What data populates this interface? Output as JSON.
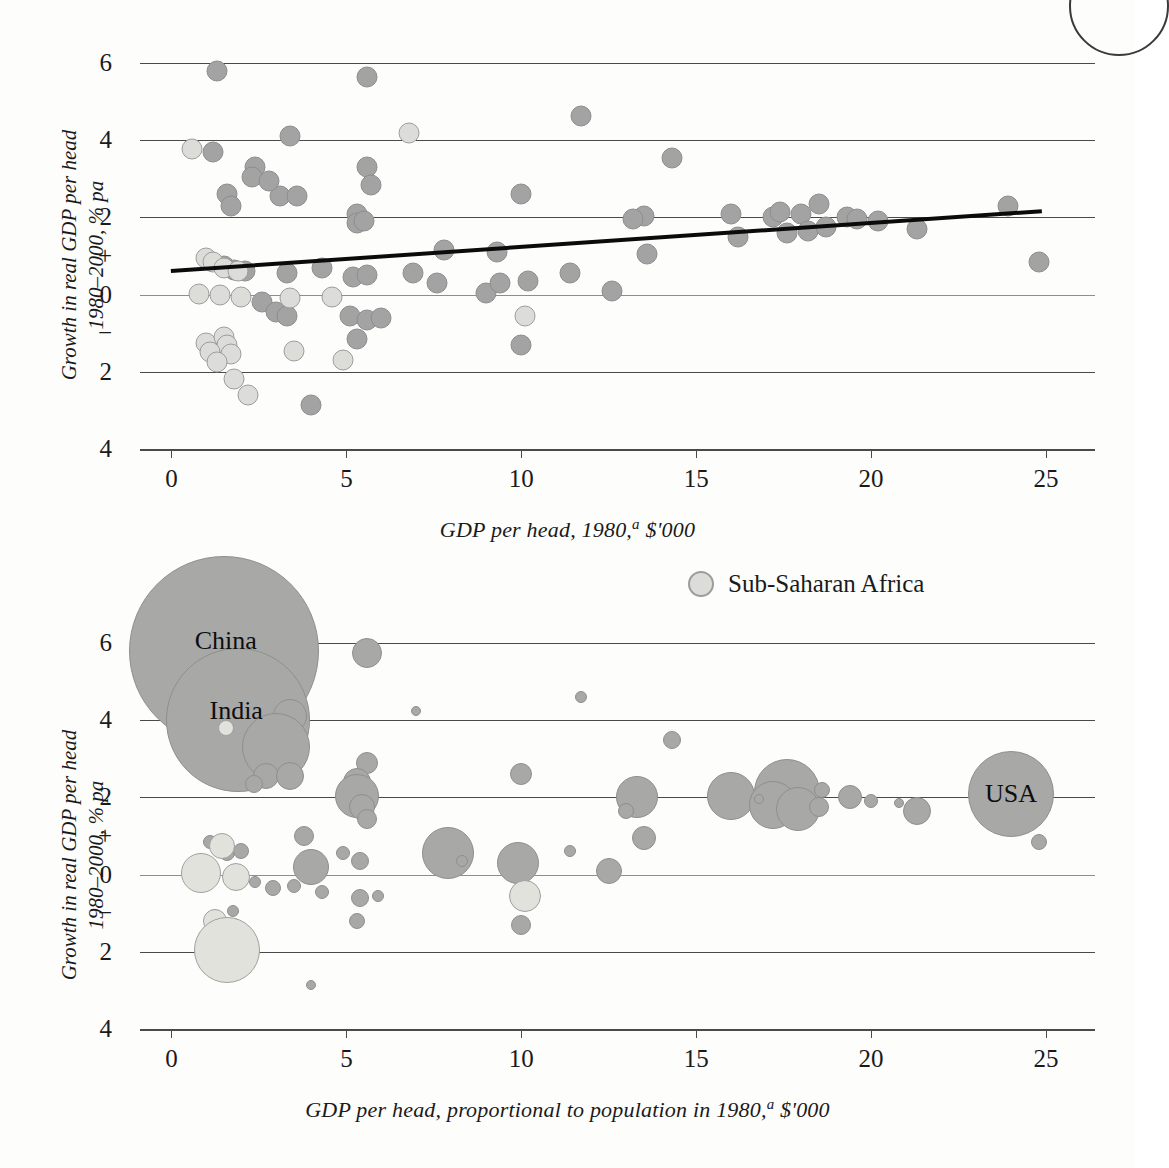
{
  "legend": {
    "label": "Sub-Saharan Africa",
    "swatch_color": "#dcdcd8",
    "position": "above-lower-chart-right"
  },
  "colors": {
    "dot_normal": "#a3a3a3",
    "dot_sub_saharan": "#dcdcd8",
    "gridline": "#4a4a4a",
    "trendline": "#0b0b0b",
    "background": "#fdfdfc"
  },
  "axis": {
    "y_ticks": [
      "6",
      "4",
      "2",
      "0",
      "2",
      "4"
    ],
    "y_tick_values": [
      6,
      4,
      2,
      0,
      -2,
      -4
    ],
    "y_sign_plus": "+",
    "y_sign_minus": "−",
    "x_ticks": [
      "0",
      "5",
      "10",
      "15",
      "20",
      "25"
    ],
    "x_tick_values": [
      0,
      5,
      10,
      15,
      20,
      25
    ],
    "y_title_line1": "Growth in real GDP per head",
    "y_title_line2": "1980–2000, % pa"
  },
  "chart_data": [
    {
      "id": "upper",
      "type": "scatter",
      "title": "",
      "xlabel": "GDP per head, 1980,ᵃ $'000",
      "xlabel_main": "GDP per head, 1980,",
      "xlabel_sup": "a",
      "xlabel_tail": " $'000",
      "ylabel": "Growth in real GDP per head 1980–2000, % pa",
      "xlim": [
        -0.9,
        26.4
      ],
      "ylim": [
        -4.6,
        6.6
      ],
      "grid": true,
      "legend_position": "none",
      "trendline": {
        "x1": 0.0,
        "y1": 0.62,
        "x2": 24.9,
        "y2": 2.17,
        "label": "fitted trend"
      },
      "series": [
        {
          "name": "Countries",
          "marker": "circle",
          "color": "#a3a3a3",
          "points": [
            {
              "x": 1.3,
              "y": 5.8
            },
            {
              "x": 5.6,
              "y": 5.65
            },
            {
              "x": 11.7,
              "y": 4.62
            },
            {
              "x": 3.4,
              "y": 4.1
            },
            {
              "x": 1.2,
              "y": 3.7
            },
            {
              "x": 14.3,
              "y": 3.55
            },
            {
              "x": 2.4,
              "y": 3.3
            },
            {
              "x": 2.3,
              "y": 3.05
            },
            {
              "x": 5.6,
              "y": 3.3
            },
            {
              "x": 5.7,
              "y": 2.85
            },
            {
              "x": 1.6,
              "y": 2.6
            },
            {
              "x": 1.7,
              "y": 2.3
            },
            {
              "x": 3.1,
              "y": 2.55
            },
            {
              "x": 3.6,
              "y": 2.55
            },
            {
              "x": 10.0,
              "y": 2.6
            },
            {
              "x": 2.8,
              "y": 2.95
            },
            {
              "x": 5.3,
              "y": 2.1
            },
            {
              "x": 5.3,
              "y": 1.85
            },
            {
              "x": 5.5,
              "y": 1.9
            },
            {
              "x": 7.8,
              "y": 1.15
            },
            {
              "x": 9.3,
              "y": 1.1
            },
            {
              "x": 13.5,
              "y": 2.05
            },
            {
              "x": 13.2,
              "y": 1.95
            },
            {
              "x": 13.6,
              "y": 1.05
            },
            {
              "x": 16.0,
              "y": 2.1
            },
            {
              "x": 16.2,
              "y": 1.5
            },
            {
              "x": 17.2,
              "y": 2.0
            },
            {
              "x": 17.4,
              "y": 2.15
            },
            {
              "x": 17.6,
              "y": 1.6
            },
            {
              "x": 18.0,
              "y": 2.1
            },
            {
              "x": 18.2,
              "y": 1.65
            },
            {
              "x": 18.5,
              "y": 2.35
            },
            {
              "x": 18.7,
              "y": 1.75
            },
            {
              "x": 19.3,
              "y": 2.0
            },
            {
              "x": 19.6,
              "y": 1.95
            },
            {
              "x": 20.2,
              "y": 1.9
            },
            {
              "x": 21.3,
              "y": 1.7
            },
            {
              "x": 23.9,
              "y": 2.3
            },
            {
              "x": 24.8,
              "y": 0.85
            },
            {
              "x": 4.3,
              "y": 0.7
            },
            {
              "x": 3.3,
              "y": 0.55
            },
            {
              "x": 5.2,
              "y": 0.45
            },
            {
              "x": 5.6,
              "y": 0.5
            },
            {
              "x": 6.9,
              "y": 0.55
            },
            {
              "x": 7.6,
              "y": 0.3
            },
            {
              "x": 9.0,
              "y": 0.05
            },
            {
              "x": 9.4,
              "y": 0.3
            },
            {
              "x": 10.2,
              "y": 0.35
            },
            {
              "x": 11.4,
              "y": 0.55
            },
            {
              "x": 12.6,
              "y": 0.1
            },
            {
              "x": 2.6,
              "y": -0.2
            },
            {
              "x": 3.0,
              "y": -0.45
            },
            {
              "x": 3.3,
              "y": -0.55
            },
            {
              "x": 5.1,
              "y": -0.55
            },
            {
              "x": 5.6,
              "y": -0.65
            },
            {
              "x": 6.0,
              "y": -0.6
            },
            {
              "x": 5.3,
              "y": -1.15
            },
            {
              "x": 10.0,
              "y": -1.3
            },
            {
              "x": 4.0,
              "y": -2.85
            },
            {
              "x": 1.5,
              "y": 0.75
            },
            {
              "x": 1.8,
              "y": 0.65
            },
            {
              "x": 2.1,
              "y": 0.6
            }
          ]
        },
        {
          "name": "Sub-Saharan Africa",
          "marker": "circle",
          "color": "#dcdcd8",
          "points": [
            {
              "x": 0.6,
              "y": 3.78
            },
            {
              "x": 6.8,
              "y": 4.2
            },
            {
              "x": 1.0,
              "y": 0.95
            },
            {
              "x": 1.2,
              "y": 0.85
            },
            {
              "x": 1.5,
              "y": 0.7
            },
            {
              "x": 1.9,
              "y": 0.6
            },
            {
              "x": 0.8,
              "y": 0.02
            },
            {
              "x": 1.4,
              "y": 0.0
            },
            {
              "x": 2.0,
              "y": -0.05
            },
            {
              "x": 3.4,
              "y": -0.1
            },
            {
              "x": 4.6,
              "y": -0.05
            },
            {
              "x": 3.5,
              "y": -1.45
            },
            {
              "x": 1.0,
              "y": -1.25
            },
            {
              "x": 1.5,
              "y": -1.1
            },
            {
              "x": 1.6,
              "y": -1.3
            },
            {
              "x": 1.1,
              "y": -1.5
            },
            {
              "x": 1.7,
              "y": -1.55
            },
            {
              "x": 1.3,
              "y": -1.75
            },
            {
              "x": 4.9,
              "y": -1.7
            },
            {
              "x": 1.8,
              "y": -2.2
            },
            {
              "x": 2.2,
              "y": -2.6
            },
            {
              "x": 10.1,
              "y": -0.55
            }
          ]
        }
      ]
    },
    {
      "id": "lower",
      "type": "scatter",
      "title": "",
      "xlabel": "GDP per head, proportional to population in 1980,ᵃ $'000",
      "xlabel_main": "GDP per head, proportional to population in 1980,",
      "xlabel_sup": "a",
      "xlabel_tail": " $'000",
      "ylabel": "Growth in real GDP per head 1980–2000, % pa",
      "xlim": [
        -0.9,
        26.4
      ],
      "ylim": [
        -4.6,
        6.6
      ],
      "grid": true,
      "bubble_size_encodes": "population in 1980",
      "legend_position": "above-right",
      "annotations": [
        {
          "text": "China",
          "x": 1.55,
          "y": 6.05
        },
        {
          "text": "India",
          "x": 1.85,
          "y": 4.25
        },
        {
          "text": "USA",
          "x": 24.0,
          "y": 2.1
        }
      ],
      "series": [
        {
          "name": "Countries",
          "marker": "bubble",
          "color": "#a8a8a6",
          "points": [
            {
              "x": 1.5,
              "y": 5.8,
              "r": 95,
              "label": "China"
            },
            {
              "x": 1.9,
              "y": 4.0,
              "r": 72,
              "label": "India"
            },
            {
              "x": 24.0,
              "y": 2.1,
              "r": 43,
              "label": "USA"
            },
            {
              "x": 5.6,
              "y": 5.75,
              "r": 15
            },
            {
              "x": 3.4,
              "y": 4.1,
              "r": 17
            },
            {
              "x": 7.0,
              "y": 4.25,
              "r": 5
            },
            {
              "x": 11.7,
              "y": 4.6,
              "r": 6
            },
            {
              "x": 3.0,
              "y": 3.3,
              "r": 34
            },
            {
              "x": 2.7,
              "y": 2.55,
              "r": 13
            },
            {
              "x": 3.4,
              "y": 2.55,
              "r": 14
            },
            {
              "x": 2.35,
              "y": 2.35,
              "r": 9
            },
            {
              "x": 5.6,
              "y": 2.9,
              "r": 11
            },
            {
              "x": 5.3,
              "y": 2.4,
              "r": 14
            },
            {
              "x": 10.0,
              "y": 2.6,
              "r": 11
            },
            {
              "x": 14.3,
              "y": 3.5,
              "r": 9
            },
            {
              "x": 5.3,
              "y": 2.05,
              "r": 22
            },
            {
              "x": 5.45,
              "y": 1.75,
              "r": 13
            },
            {
              "x": 5.6,
              "y": 1.45,
              "r": 10
            },
            {
              "x": 13.3,
              "y": 2.0,
              "r": 21
            },
            {
              "x": 13.0,
              "y": 1.65,
              "r": 8
            },
            {
              "x": 16.0,
              "y": 2.05,
              "r": 24
            },
            {
              "x": 17.6,
              "y": 2.15,
              "r": 33
            },
            {
              "x": 17.2,
              "y": 1.8,
              "r": 24
            },
            {
              "x": 17.9,
              "y": 1.7,
              "r": 22
            },
            {
              "x": 18.6,
              "y": 2.2,
              "r": 8
            },
            {
              "x": 18.5,
              "y": 1.75,
              "r": 10
            },
            {
              "x": 19.4,
              "y": 2.0,
              "r": 12
            },
            {
              "x": 20.0,
              "y": 1.9,
              "r": 7
            },
            {
              "x": 21.3,
              "y": 1.65,
              "r": 14
            },
            {
              "x": 24.8,
              "y": 0.85,
              "r": 8
            },
            {
              "x": 3.8,
              "y": 1.0,
              "r": 10
            },
            {
              "x": 4.0,
              "y": 0.2,
              "r": 18
            },
            {
              "x": 4.9,
              "y": 0.55,
              "r": 7
            },
            {
              "x": 5.4,
              "y": 0.35,
              "r": 9
            },
            {
              "x": 7.9,
              "y": 0.55,
              "r": 26
            },
            {
              "x": 8.3,
              "y": 0.35,
              "r": 6
            },
            {
              "x": 9.9,
              "y": 0.3,
              "r": 21
            },
            {
              "x": 11.4,
              "y": 0.6,
              "r": 6
            },
            {
              "x": 12.5,
              "y": 0.1,
              "r": 13
            },
            {
              "x": 13.5,
              "y": 0.95,
              "r": 12
            },
            {
              "x": 1.1,
              "y": 0.85,
              "r": 7
            },
            {
              "x": 1.45,
              "y": 0.8,
              "r": 6
            },
            {
              "x": 1.6,
              "y": 0.55,
              "r": 8
            },
            {
              "x": 2.0,
              "y": 0.6,
              "r": 8
            },
            {
              "x": 2.4,
              "y": -0.2,
              "r": 6
            },
            {
              "x": 2.9,
              "y": -0.35,
              "r": 8
            },
            {
              "x": 3.5,
              "y": -0.3,
              "r": 7
            },
            {
              "x": 4.3,
              "y": -0.45,
              "r": 7
            },
            {
              "x": 5.4,
              "y": -0.6,
              "r": 9
            },
            {
              "x": 5.9,
              "y": -0.55,
              "r": 6
            },
            {
              "x": 5.3,
              "y": -1.2,
              "r": 8
            },
            {
              "x": 10.0,
              "y": -1.3,
              "r": 10
            },
            {
              "x": 1.75,
              "y": -0.95,
              "r": 6
            },
            {
              "x": 1.8,
              "y": -1.3,
              "r": 7
            },
            {
              "x": 1.9,
              "y": -1.5,
              "r": 6
            },
            {
              "x": 4.0,
              "y": -2.85,
              "r": 5
            },
            {
              "x": 16.8,
              "y": 1.95,
              "r": 5
            },
            {
              "x": 20.8,
              "y": 1.85,
              "r": 5
            }
          ]
        },
        {
          "name": "Sub-Saharan Africa",
          "marker": "bubble",
          "color": "#e2e2dd",
          "points": [
            {
              "x": 1.45,
              "y": 0.75,
              "r": 13
            },
            {
              "x": 1.55,
              "y": 3.8,
              "r": 8
            },
            {
              "x": 0.85,
              "y": 0.05,
              "r": 20
            },
            {
              "x": 1.85,
              "y": -0.05,
              "r": 14
            },
            {
              "x": 1.25,
              "y": -1.2,
              "r": 12
            },
            {
              "x": 1.6,
              "y": -1.95,
              "r": 33
            },
            {
              "x": 10.1,
              "y": -0.55,
              "r": 16
            }
          ]
        }
      ]
    }
  ]
}
